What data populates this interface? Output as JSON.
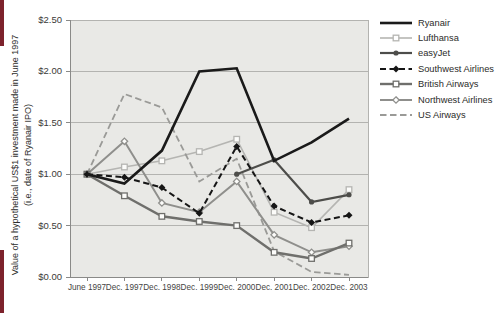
{
  "page": {
    "accent_color": "#7d222c"
  },
  "chart_data": {
    "type": "line",
    "title": "",
    "ylabel_line1": "Value of a hypothetical US$1 investment made in June 1997",
    "ylabel_line2": "(i.e., date of Ryanair IPO)",
    "categories": [
      "June 1997",
      "Dec. 1997",
      "Dec. 1998",
      "Dec. 1999",
      "Dec. 2000",
      "Dec. 2001",
      "Dec. 2002",
      "Dec. 2003"
    ],
    "y_ticks": [
      "$2.50",
      "$2.00",
      "$1.50",
      "$1.00",
      "$0.50",
      "$0.00"
    ],
    "ylim": [
      0,
      2.5
    ],
    "grid": true,
    "legend_position": "right",
    "plot_bg": "#e9e9e6",
    "grid_color": "#b3b3b0",
    "axis_color": "#8a8a88",
    "series": [
      {
        "name": "Ryanair",
        "color": "#1a1a1a",
        "dash": "none",
        "width": 2.6,
        "marker": "none",
        "values": [
          1.0,
          0.91,
          1.23,
          2.0,
          2.03,
          1.13,
          1.31,
          1.54
        ]
      },
      {
        "name": "Lufthansa",
        "color": "#b5b5b2",
        "dash": "none",
        "width": 1.6,
        "marker": "open-square",
        "values": [
          1.0,
          1.07,
          1.13,
          1.22,
          1.34,
          0.63,
          0.48,
          0.85
        ]
      },
      {
        "name": "easyJet",
        "color": "#4d4d4a",
        "dash": "none",
        "width": 2.2,
        "marker": "filled-circle",
        "values": [
          null,
          null,
          null,
          null,
          1.0,
          1.14,
          0.73,
          0.8
        ]
      },
      {
        "name": "Southwest Airlines",
        "color": "#161616",
        "dash": "6,3.5",
        "width": 2.0,
        "marker": "filled-diamond",
        "values": [
          1.0,
          0.97,
          0.87,
          0.62,
          1.27,
          0.69,
          0.53,
          0.6
        ]
      },
      {
        "name": "British Airways",
        "color": "#6f6f6c",
        "dash": "none",
        "width": 2.4,
        "marker": "open-square",
        "values": [
          1.0,
          0.79,
          0.59,
          0.54,
          0.5,
          0.24,
          0.18,
          0.33
        ]
      },
      {
        "name": "Northwest Airlines",
        "color": "#8f8f8c",
        "dash": "none",
        "width": 2.0,
        "marker": "open-diamond",
        "values": [
          1.0,
          1.32,
          0.72,
          0.63,
          0.93,
          0.41,
          0.24,
          0.3
        ]
      },
      {
        "name": "US Airways",
        "color": "#9a9a97",
        "dash": "6.5,3.5",
        "width": 1.8,
        "marker": "none",
        "values": [
          1.0,
          1.78,
          1.65,
          0.93,
          1.15,
          0.25,
          0.05,
          0.02
        ]
      }
    ]
  }
}
